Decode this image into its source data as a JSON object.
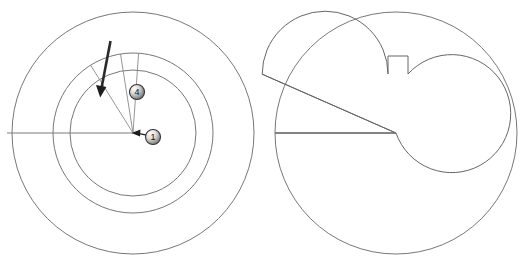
{
  "figure": {
    "stroke_color": "#777777",
    "accent_color": "#1d1d1d",
    "background_color": "#ffffff",
    "width": 525,
    "height": 275
  },
  "left_view": {
    "name": "Left sectional view",
    "center": {
      "x": 133,
      "y": 133
    },
    "circles": [
      {
        "label": "outer boundary circle",
        "radius": 121
      },
      {
        "label": "middle circle",
        "radius": 80
      },
      {
        "label": "inner circle",
        "radius": 63
      }
    ],
    "axis_line": {
      "label": "horizontal center axis",
      "x1": 7,
      "y1": 133,
      "x2": 133,
      "y2": 133
    },
    "radial_lines": [
      {
        "label": "radial line left",
        "angle_deg": 122,
        "length": 80
      },
      {
        "label": "radial line middle",
        "angle_deg": 99,
        "length": 80
      },
      {
        "label": "radial line right",
        "angle_deg": 86,
        "length": 80
      }
    ],
    "direction_arrow": {
      "label": "motion direction arrow",
      "x1": 110,
      "y1": 41,
      "x2": 100,
      "y2": 94
    },
    "balloons": [
      {
        "label": "4",
        "name": "callout-balloon-4",
        "cx": 137,
        "cy": 92,
        "r": 7.5
      },
      {
        "label": "1",
        "name": "callout-balloon-1",
        "cx": 153,
        "cy": 137,
        "r": 7.5,
        "leader": {
          "x1": 146,
          "y1": 135,
          "x2": 133,
          "y2": 133
        }
      }
    ]
  },
  "right_view": {
    "name": "Right sectional view",
    "center": {
      "x": 396,
      "y": 133
    },
    "circles": [
      {
        "label": "outer boundary circle",
        "radius": 121
      },
      {
        "label": "inner rotor circle",
        "radius": 59
      }
    ],
    "axis_line": {
      "label": "horizontal center axis",
      "x1": 275,
      "y1": 133,
      "x2": 396,
      "y2": 133
    },
    "notch": {
      "label": "wedge notch cut-out",
      "apex": {
        "x": 396,
        "y": 133
      },
      "start_angle_deg": 180,
      "end_angle_deg": 125
    },
    "tab": {
      "label": "keyway tab",
      "x": 388,
      "y": 56,
      "width": 20,
      "height": 18
    }
  },
  "annotations": {
    "balloon_labels": [
      "1",
      "4"
    ]
  }
}
